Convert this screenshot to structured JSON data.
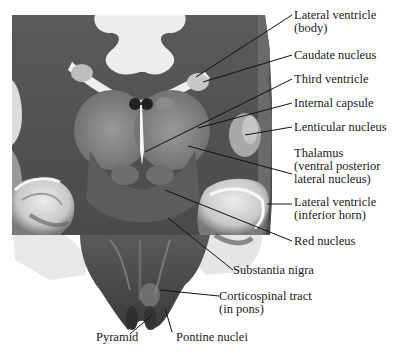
{
  "figure": {
    "labels": [
      {
        "id": "lateral-ventricle-body",
        "lines": [
          "Lateral ventricle",
          "(body)"
        ],
        "x": 294,
        "y": 9
      },
      {
        "id": "caudate-nucleus",
        "lines": [
          "Caudate nucleus"
        ],
        "x": 294,
        "y": 49
      },
      {
        "id": "third-ventricle",
        "lines": [
          "Third ventricle"
        ],
        "x": 294,
        "y": 73
      },
      {
        "id": "internal-capsule",
        "lines": [
          "Internal capsule"
        ],
        "x": 294,
        "y": 97
      },
      {
        "id": "lenticular-nucleus",
        "lines": [
          "Lenticular nucleus"
        ],
        "x": 294,
        "y": 121
      },
      {
        "id": "thalamus",
        "lines": [
          "Thalamus",
          "(ventral posterior",
          "lateral nucleus)"
        ],
        "x": 294,
        "y": 147
      },
      {
        "id": "lateral-ventricle-inferior-horn",
        "lines": [
          "Lateral ventricle",
          "(inferior horn)"
        ],
        "x": 294,
        "y": 196
      },
      {
        "id": "red-nucleus",
        "lines": [
          "Red nucleus"
        ],
        "x": 294,
        "y": 235
      },
      {
        "id": "substantia-nigra",
        "lines": [
          "Substantia nigra"
        ],
        "x": 233,
        "y": 264
      },
      {
        "id": "corticospinal-tract",
        "lines": [
          "Corticospinal tract",
          "(in pons)"
        ],
        "x": 219,
        "y": 290
      },
      {
        "id": "pyramid",
        "lines": [
          "Pyramid"
        ],
        "x": 96,
        "y": 331
      },
      {
        "id": "pontine-nuclei",
        "lines": [
          "Pontine nuclei"
        ],
        "x": 176,
        "y": 331
      }
    ],
    "colors": {
      "background": "#ffffff",
      "text": "#1a1a1a",
      "leader": "#111111",
      "tissue_dark": "#3a3a3a",
      "tissue_mid": "#6e6e6e",
      "tissue_light": "#9a9a9a",
      "white_matter": "#e8e8e8"
    }
  }
}
